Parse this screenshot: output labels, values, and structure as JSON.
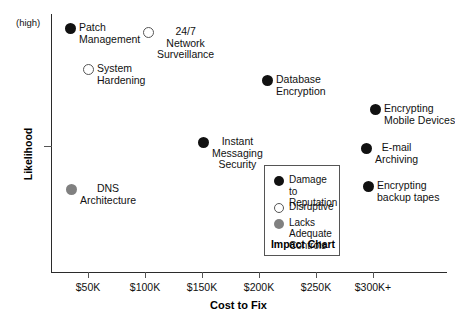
{
  "chart_data": {
    "type": "scatter",
    "title": "Impact Chart",
    "xlabel": "Cost to Fix",
    "ylabel": "Likelihood",
    "y_high_label": "(high)",
    "grid": false,
    "legend_position": "inside-bottom-center",
    "xticks": [
      "$50K",
      "$100K",
      "$150K",
      "$200K",
      "$250K",
      "$300K+"
    ],
    "xlim": [
      "$25K",
      "$325K"
    ],
    "ylim": [
      "low",
      "high"
    ],
    "categories": [
      {
        "key": "damage",
        "label": "Damage to Reputation",
        "marker": "filled",
        "color": "#111111"
      },
      {
        "key": "disruptive",
        "label": "Disruptive",
        "marker": "open",
        "color": "#ffffff"
      },
      {
        "key": "lacks",
        "label": "Lacks Adequate Controls",
        "marker": "gray",
        "color": "#808080"
      }
    ],
    "points": [
      {
        "label": "Patch\nManagement",
        "x": "$35K",
        "y": "high",
        "category": "damage",
        "marker": "filled",
        "px": 65,
        "py": 23,
        "label_lines": [
          "Patch",
          "Management"
        ],
        "label_align": "left"
      },
      {
        "label": "24/7\nNetwork\nSurveillance",
        "x": "$105K",
        "y": "high",
        "category": "disruptive",
        "marker": "open",
        "px": 143,
        "py": 27,
        "label_lines": [
          "24/7",
          "Network",
          "Surveillance"
        ],
        "label_align": "center"
      },
      {
        "label": "System\nHardening",
        "x": "$54K",
        "y": "high-mid",
        "category": "disruptive",
        "marker": "open",
        "px": 83,
        "py": 64,
        "label_lines": [
          "System",
          "Hardening"
        ],
        "label_align": "left"
      },
      {
        "label": "Database\nEncryption",
        "x": "$208K",
        "y": "mid-high",
        "category": "damage",
        "marker": "filled",
        "px": 262,
        "py": 75,
        "label_lines": [
          "Database",
          "Encryption"
        ],
        "label_align": "left"
      },
      {
        "label": "Encrypting\nMobile Devices",
        "x": "$302K",
        "y": "mid",
        "category": "damage",
        "marker": "filled",
        "px": 370,
        "py": 104,
        "label_lines": [
          "Encrypting",
          "Mobile Devices"
        ],
        "label_align": "left"
      },
      {
        "label": "Instant\nMessaging\nSecurity",
        "x": "$154K",
        "y": "mid-low",
        "category": "damage",
        "marker": "filled",
        "px": 198,
        "py": 137,
        "label_lines": [
          "Instant",
          "Messaging",
          "Security"
        ],
        "label_align": "center"
      },
      {
        "label": "E-mail\nArchiving",
        "x": "$293K",
        "y": "mid-low",
        "category": "damage",
        "marker": "filled",
        "px": 361,
        "py": 143,
        "label_lines": [
          "E-mail",
          "Archiving"
        ],
        "label_align": "center"
      },
      {
        "label": "DNS\nArchitecture",
        "x": "$44K",
        "y": "low",
        "category": "lacks",
        "marker": "gray",
        "px": 66,
        "py": 184,
        "label_lines": [
          "DNS",
          "Architecture"
        ],
        "label_align": "center"
      },
      {
        "label": "Encrypting\nbackup tapes",
        "x": "$295K",
        "y": "low",
        "category": "damage",
        "marker": "filled",
        "px": 363,
        "py": 181,
        "label_lines": [
          "Encrypting",
          "backup tapes"
        ],
        "label_align": "left"
      }
    ]
  },
  "legend": {
    "title": "Impact Chart",
    "items": [
      {
        "marker": "filled",
        "lines": [
          "Damage to",
          "Reputation"
        ]
      },
      {
        "marker": "open",
        "lines": [
          "Disruptive"
        ]
      },
      {
        "marker": "gray",
        "lines": [
          "Lacks",
          "Adequate",
          "Controls"
        ]
      }
    ]
  }
}
